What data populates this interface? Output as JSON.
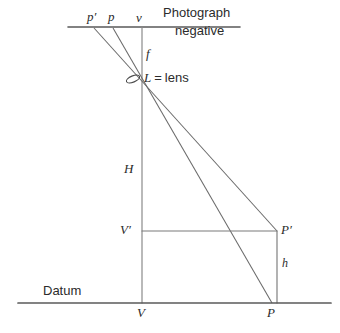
{
  "figure": {
    "type": "geometry-diagram",
    "background_color": "#ffffff",
    "line_color": "#5a5a5a",
    "text_color": "#2b2b2b"
  },
  "labels": {
    "p_prime": "p′",
    "p": "p",
    "v": "v",
    "photograph": "Photograph",
    "negative": "negative",
    "f": "f",
    "lens_symbol": "L",
    "lens_equals": "=",
    "lens_word": "lens",
    "H": "H",
    "V_prime": "V′",
    "P_prime": "P′",
    "h": "h",
    "datum": "Datum",
    "V": "V",
    "P": "P"
  },
  "geometry": {
    "photo_line": {
      "x1": 68,
      "y1": 27,
      "x2": 240,
      "y2": 27
    },
    "datum_line": {
      "x1": 18,
      "y1": 303,
      "x2": 331,
      "y2": 303
    },
    "vertical_axis": {
      "x": 142,
      "y1": 27,
      "y2": 303
    },
    "lens_point": {
      "x": 133,
      "y": 79
    },
    "lens_ellipse": {
      "cx": 133,
      "cy": 79,
      "rx": 7,
      "ry": 3,
      "rotation": -22
    },
    "ray_pprime_to_P_prime": {
      "x1": 94,
      "y1": 28,
      "x2": 277,
      "y2": 231
    },
    "ray_p_to_P": {
      "x1": 113,
      "y1": 28,
      "x2": 272,
      "y2": 303
    },
    "vprime_horizontal": {
      "x1": 142,
      "y1": 231,
      "x2": 277,
      "y2": 231
    },
    "pprime_vertical": {
      "x": 277,
      "y1": 231,
      "y2": 303
    },
    "points": {
      "p_prime_on_photo": {
        "x": 94,
        "y": 27
      },
      "p_on_photo": {
        "x": 113,
        "y": 27
      },
      "v_on_photo": {
        "x": 142,
        "y": 27
      },
      "V": {
        "x": 142,
        "y": 303
      },
      "V_prime": {
        "x": 142,
        "y": 231
      },
      "P": {
        "x": 272,
        "y": 303
      },
      "P_prime": {
        "x": 277,
        "y": 231
      }
    }
  },
  "label_positions": {
    "p_prime": {
      "x": 87,
      "y": 10
    },
    "p": {
      "x": 108,
      "y": 10
    },
    "v": {
      "x": 136,
      "y": 11
    },
    "photograph": {
      "x": 163,
      "y": 7
    },
    "negative": {
      "x": 175,
      "y": 25
    },
    "f": {
      "x": 146,
      "y": 48
    },
    "lens": {
      "x": 144,
      "y": 72
    },
    "H": {
      "x": 124,
      "y": 163
    },
    "V_prime": {
      "x": 121,
      "y": 224
    },
    "P_prime": {
      "x": 281,
      "y": 224
    },
    "h": {
      "x": 282,
      "y": 258
    },
    "datum": {
      "x": 43,
      "y": 286
    },
    "V": {
      "x": 137,
      "y": 306
    },
    "P": {
      "x": 267,
      "y": 306
    }
  }
}
